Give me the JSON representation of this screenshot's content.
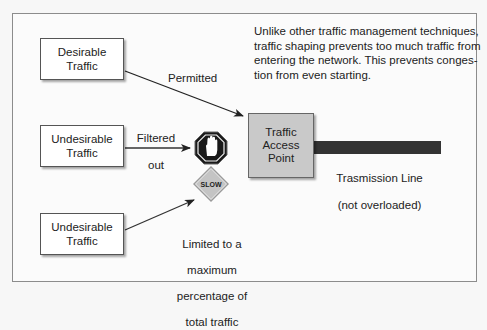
{
  "diagram": {
    "title_note": "Unlike other traffic management techniques, traffic shaping prevents too much traffic from entering the network. This prevents conges-tion from even starting.",
    "note_lines": [
      "Unlike other traffic management techniques,",
      "traffic shaping prevents too much traffic from",
      "entering the network. This prevents conges-",
      "tion from even starting."
    ],
    "sources": [
      {
        "label_line1": "Desirable",
        "label_line2": "Traffic",
        "outcome": "Permitted"
      },
      {
        "label_line1": "Undesirable",
        "label_line2": "Traffic",
        "outcome": "Filtered out"
      },
      {
        "label_line1": "Undesirable",
        "label_line2": "Traffic",
        "outcome": "Limited to a maximum percentage of total traffic"
      }
    ],
    "edge_labels": {
      "permitted": "Permitted",
      "filtered_line1": "Filtered",
      "filtered_line2": "out",
      "limited_line1": "Limited to a",
      "limited_line2": "maximum",
      "limited_line3": "percentage of",
      "limited_line4": "total traffic"
    },
    "access_point": {
      "line1": "Traffic",
      "line2": "Access",
      "line3": "Point"
    },
    "transmission_line": {
      "line1": "Trasmission Line",
      "line2": "(not overloaded)"
    },
    "icons": {
      "stop": "stop-hand-sign",
      "slow": "slow-diamond-sign",
      "slow_text": "SLOW"
    },
    "colors": {
      "access_point_fill": "#c9c9c9",
      "transmission_line": "#333333",
      "stop_sign": "#1a1a1a",
      "slow_sign": "#bdbdbd",
      "frame_border": "#8c8c8c"
    }
  }
}
